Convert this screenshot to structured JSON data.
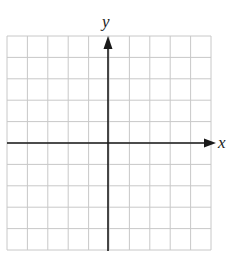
{
  "figure": {
    "type": "coordinate-grid",
    "x_axis_label": "x",
    "y_axis_label": "y",
    "columns": 10,
    "rows": 10,
    "origin_column": 5,
    "origin_row": 5,
    "grid_color": "#c8c8c8",
    "axis_color": "#1a1a1a"
  }
}
